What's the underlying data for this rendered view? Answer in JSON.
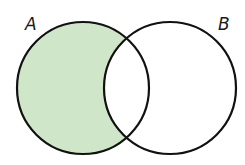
{
  "diagram": {
    "type": "venn",
    "shaded_region": "A minus B",
    "colors": {
      "fill": "#cfe6c8",
      "stroke": "#111111",
      "background": "#ffffff"
    },
    "sets": [
      {
        "id": "A",
        "label": "A",
        "cx": 83,
        "cy": 88,
        "r": 66
      },
      {
        "id": "B",
        "label": "B",
        "cx": 170,
        "cy": 88,
        "r": 66
      }
    ]
  }
}
